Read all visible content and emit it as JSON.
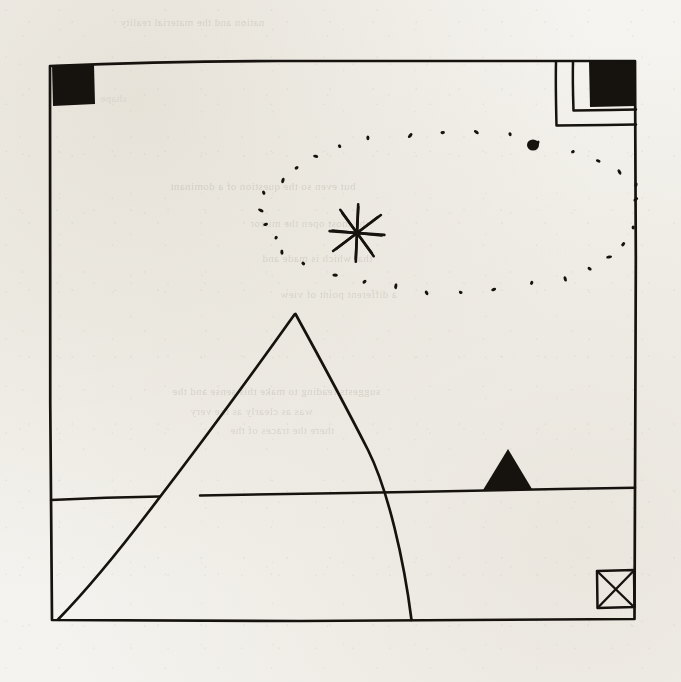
{
  "page": {
    "title": "Hand-drawn ink sketch",
    "width": 681,
    "height": 682,
    "paper_color": "#f4f2ee",
    "ink_color": "#16130f"
  },
  "ghost_text": {
    "note": "Faint text showing through from the reverse side of the paper",
    "lines": [
      {
        "text": "nation and the material reality",
        "x": 120,
        "y": 16,
        "size": 11,
        "opacity": 0.2
      },
      {
        "text": "but even so the question of a dominant",
        "x": 170,
        "y": 180,
        "size": 11,
        "opacity": 0.22
      },
      {
        "text": "the most open the mirror",
        "x": 250,
        "y": 217,
        "size": 11,
        "opacity": 0.2
      },
      {
        "text": "that which is made and",
        "x": 262,
        "y": 252,
        "size": 11,
        "opacity": 0.2
      },
      {
        "text": "a different point of view",
        "x": 280,
        "y": 288,
        "size": 11,
        "opacity": 0.2
      },
      {
        "text": "suggests reading to make this sense and the",
        "x": 172,
        "y": 385,
        "size": 11,
        "opacity": 0.22
      },
      {
        "text": "was as clearly as the very",
        "x": 190,
        "y": 405,
        "size": 11,
        "opacity": 0.2
      },
      {
        "text": "there the traces of the",
        "x": 230,
        "y": 424,
        "size": 11,
        "opacity": 0.2
      },
      {
        "text": "shape",
        "x": 100,
        "y": 92,
        "size": 11,
        "opacity": 0.14
      }
    ]
  },
  "artwork": {
    "description": "Hand-drawn ink landscape: bordered frame, large pyramid, horizon, radiant star with dotted orbit, corner markers",
    "elements": [
      {
        "name": "frame-border",
        "type": "rectangle-outline",
        "label": "Main hand-drawn rectangular border",
        "path": "M 50 64 L 635 60 L 635 620 L 51 620 Z",
        "stroke_width": 2.6
      },
      {
        "name": "top-left-filled-square",
        "type": "filled-square",
        "label": "Solid black square at top-left corner",
        "x": 52,
        "y": 64,
        "width": 42,
        "height": 41
      },
      {
        "name": "top-right-filled-square",
        "type": "filled-square",
        "label": "Solid black square at top-right corner",
        "x": 588,
        "y": 62,
        "width": 47,
        "height": 45
      },
      {
        "name": "top-right-nested-corner-outer",
        "type": "corner-outline",
        "label": "Outer nested L-shaped corner line at top-right",
        "path": "M 557 63 L 557 125 L 636 125",
        "stroke_width": 2.4
      },
      {
        "name": "top-right-nested-corner-inner",
        "type": "corner-outline",
        "label": "Inner nested L-shaped corner line at top-right",
        "path": "M 573 62 L 573 110 L 636 110",
        "stroke_width": 2.4
      },
      {
        "name": "large-pyramid",
        "type": "triangle-outline",
        "label": "Large pyramid / triangle, apex upper-centre, base on bottom border",
        "apex": [
          295,
          314
        ],
        "left_foot": [
          57,
          620
        ],
        "right_foot": [
          412,
          620
        ],
        "stroke_width": 2.6
      },
      {
        "name": "horizon-line",
        "type": "line",
        "label": "Horizontal horizon line crossing the frame",
        "path": "M 51 500 L 350 493 L 635 488",
        "stroke_width": 2.4
      },
      {
        "name": "small-filled-triangle",
        "type": "filled-triangle",
        "label": "Small solid black triangle sitting on the horizon",
        "apex": [
          508,
          449
        ],
        "left_foot": [
          484,
          489
        ],
        "right_foot": [
          531,
          489
        ]
      },
      {
        "name": "crossed-square",
        "type": "square-with-x",
        "label": "Small square with an X through it near bottom-right corner",
        "x": 596,
        "y": 570,
        "width": 38,
        "height": 38
      },
      {
        "name": "radiant-star",
        "type": "asterisk",
        "label": "Eight-rayed asterisk star (sun)",
        "center": [
          357,
          233
        ],
        "radius": 28,
        "rays": 8,
        "stroke_width": 2.6
      },
      {
        "name": "dotted-orbit",
        "type": "dotted-ellipse",
        "label": "Dotted elliptical orbit path encircling the star",
        "center": [
          452,
          212
        ],
        "radius_x": 190,
        "radius_y": 80,
        "dot_count": 34,
        "dot_size": 5
      },
      {
        "name": "solid-dot-planet",
        "type": "filled-dot",
        "label": "Larger solid ink dot above the orbit path",
        "cx": 533,
        "cy": 145,
        "r": 5.5
      }
    ]
  }
}
